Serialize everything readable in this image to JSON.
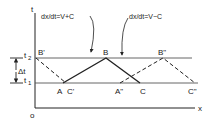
{
  "diagram": {
    "axes": {
      "y_label": "t",
      "x_label": "x",
      "origin_label": "o"
    },
    "levels": {
      "t2_label": "t",
      "t2_sub": "2",
      "t1_label": "t",
      "t1_sub": "1",
      "delta_label": "Δt"
    },
    "equations": {
      "left": "dx/dt=V+C",
      "right": "dx/dt=V−C"
    },
    "points": {
      "A": "A",
      "B": "B",
      "C": "C",
      "B_prime": "B'",
      "C_prime": "C'",
      "A_dbl": "A\"",
      "B_dbl": "B\"",
      "C_dbl": "C\""
    },
    "colors": {
      "line": "#222222",
      "level_line": "#555555"
    }
  }
}
